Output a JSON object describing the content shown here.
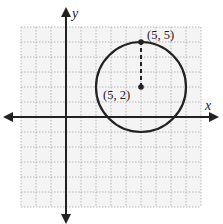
{
  "chart_data": {
    "type": "scatter",
    "title": "",
    "xlabel": "x",
    "ylabel": "y",
    "xlim": [
      -3,
      9
    ],
    "ylim": [
      -6,
      6
    ],
    "grid": true,
    "grid_style": "dotted",
    "tick_labels": false,
    "shapes": [
      {
        "kind": "circle",
        "center": [
          5,
          2
        ],
        "radius": 3
      }
    ],
    "points": [
      {
        "label": "(5, 2)",
        "x": 5,
        "y": 2,
        "role": "center"
      },
      {
        "label": "(5, 5)",
        "x": 5,
        "y": 5,
        "role": "point-on-circle"
      }
    ],
    "segments": [
      {
        "from": [
          5,
          2
        ],
        "to": [
          5,
          5
        ],
        "style": "dashed",
        "meaning": "radius"
      }
    ]
  },
  "labels": {
    "x_axis": "x",
    "y_axis": "y",
    "center": "(5, 2)",
    "top_point": "(5, 5)"
  },
  "colors": {
    "grid": "#9a9a9a",
    "grid_bg": "#f4f4f4",
    "axis": "#222222",
    "circle": "#222222"
  }
}
